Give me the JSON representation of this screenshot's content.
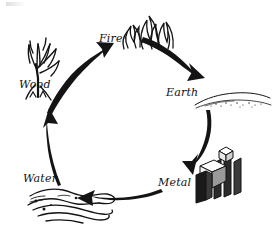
{
  "diagram": {
    "type": "cycle",
    "style": "hand-drawn sketch, black ink on white",
    "direction": "clockwise",
    "nodes": [
      {
        "id": "wood",
        "label": "Wood",
        "icon": "bare-tree-icon",
        "x": 48,
        "y": 78,
        "label_x": 19,
        "label_y": 79
      },
      {
        "id": "fire",
        "label": "Fire",
        "icon": "flames-icon",
        "x": 140,
        "y": 33,
        "label_x": 99,
        "label_y": 33
      },
      {
        "id": "earth",
        "label": "Earth",
        "icon": "ground-soil-icon",
        "x": 225,
        "y": 95,
        "label_x": 166,
        "label_y": 87
      },
      {
        "id": "metal",
        "label": "Metal",
        "icon": "metal-ingots-icon",
        "x": 213,
        "y": 175,
        "label_x": 158,
        "label_y": 177
      },
      {
        "id": "water",
        "label": "Water",
        "icon": "water-puddle-icon",
        "x": 70,
        "y": 205,
        "label_x": 23,
        "label_y": 173
      }
    ],
    "edges": [
      {
        "id": "wood-to-fire",
        "from": "Wood",
        "to": "Fire"
      },
      {
        "id": "fire-to-earth",
        "from": "Fire",
        "to": "Earth"
      },
      {
        "id": "earth-to-metal",
        "from": "Earth",
        "to": "Metal"
      },
      {
        "id": "metal-to-water",
        "from": "Metal",
        "to": "Water"
      },
      {
        "id": "water-to-wood",
        "from": "Water",
        "to": "Wood"
      }
    ],
    "colors": {
      "ink": "#141414",
      "background": "#ffffff"
    }
  }
}
